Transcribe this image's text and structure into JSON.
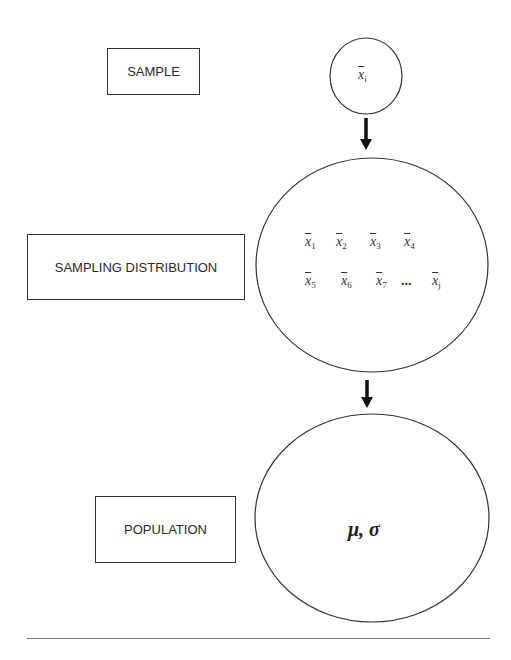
{
  "labels": {
    "sample": "SAMPLE",
    "sampling_distribution": "SAMPLING DISTRIBUTION",
    "population": "POPULATION"
  },
  "sample_circle": {
    "symbol": "x",
    "subscript": "i"
  },
  "sampling_distribution_circle": {
    "row1": [
      {
        "symbol": "x",
        "subscript": "1"
      },
      {
        "symbol": "x",
        "subscript": "2"
      },
      {
        "symbol": "x",
        "subscript": "3"
      },
      {
        "symbol": "x",
        "subscript": "4"
      }
    ],
    "row2": [
      {
        "symbol": "x",
        "subscript": "5"
      },
      {
        "symbol": "x",
        "subscript": "6"
      },
      {
        "symbol": "x",
        "subscript": "7"
      },
      {
        "ellipsis": "..."
      },
      {
        "symbol": "x",
        "subscript": "j"
      }
    ]
  },
  "population_circle": {
    "parameters": "μ, σ"
  },
  "colors": {
    "stroke": "#333333",
    "text": "#2a2a2a",
    "background": "#ffffff"
  }
}
